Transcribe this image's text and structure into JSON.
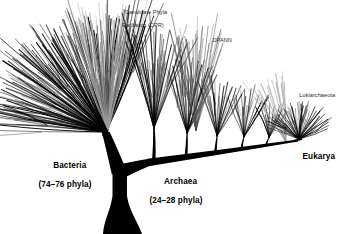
{
  "figure": {
    "background_color": "#ffffff",
    "ink_color": "#000000",
    "muted_ink_color": "#8a8a8a"
  },
  "labels": {
    "bacteria": {
      "name": "Bacteria",
      "count": "(74–76 phyla)"
    },
    "archaea": {
      "name": "Archaea",
      "count": "(24–28 phyla)"
    },
    "eukarya": {
      "name": "Eukarya"
    },
    "cpr": {
      "line1": "Candidate Phyla",
      "line2": "Radiation (CPR)"
    },
    "dpann": {
      "name": "DPANN"
    },
    "lokiarchaeota": {
      "name": "Lokiarchaeota"
    }
  },
  "chart_data": {
    "type": "diagram",
    "subtype": "phylogenetic-tree",
    "root": {
      "id": "root",
      "label": "",
      "trunk_base_x": 122,
      "trunk_base_y": 234
    },
    "domains": [
      {
        "id": "bacteria",
        "label": "Bacteria",
        "phyla_count_text": "(74–76 phyla)",
        "phyla_min": 74,
        "phyla_max": 76,
        "fan_origin": [
          106,
          132
        ],
        "fan_angle_start_deg": 182,
        "fan_angle_end_deg": 292,
        "fan_radius": 118,
        "branch_count": 74,
        "color": "#000000",
        "subclades": [
          {
            "id": "cpr",
            "label": "Candidate Phyla Radiation (CPR)",
            "color": "#9a9a9a",
            "fan_angle_start_deg": 247,
            "fan_angle_end_deg": 288,
            "branch_count": 26
          }
        ]
      },
      {
        "id": "archaea",
        "label": "Archaea",
        "phyla_count_text": "(24–28 phyla)",
        "phyla_min": 24,
        "phyla_max": 28,
        "spine_start": [
          146,
          163
        ],
        "spine_end": [
          300,
          140
        ],
        "cluster_count": 5,
        "branch_count": 60,
        "color": "#000000",
        "subclades": [
          {
            "id": "dpann",
            "label": "DPANN",
            "color": "#4a4a4a",
            "fan_origin": [
              196,
              130
            ],
            "branch_count": 18
          },
          {
            "id": "lokiarchaeota",
            "label": "Lokiarchaeota",
            "color": "#9a9a9a",
            "fan_origin": [
              286,
              142
            ],
            "branch_count": 10
          }
        ]
      },
      {
        "id": "eukarya",
        "label": "Eukarya",
        "fan_origin": [
          299,
          139
        ],
        "fan_angle_start_deg": 200,
        "fan_angle_end_deg": 340,
        "fan_radius": 34,
        "branch_count": 30,
        "color": "#000000"
      }
    ],
    "legend": null,
    "grid": false,
    "axes": false
  }
}
